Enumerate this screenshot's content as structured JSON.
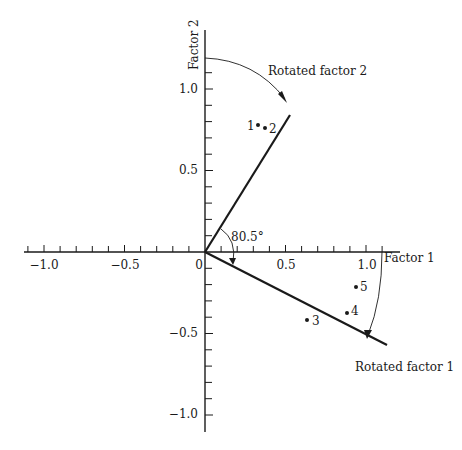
{
  "axes": {
    "x_label": "Factor 1",
    "y_label": "Factor 2",
    "x_ticks": [
      {
        "value": -1.0,
        "label": "−1.0"
      },
      {
        "value": -0.5,
        "label": "−0.5"
      },
      {
        "value": 0,
        "label": "0"
      },
      {
        "value": 0.5,
        "label": "0.5"
      },
      {
        "value": 1.0,
        "label": "1.0"
      }
    ],
    "y_ticks": [
      {
        "value": 1.0,
        "label": "1.0"
      },
      {
        "value": 0.5,
        "label": "0.5"
      },
      {
        "value": -0.5,
        "label": "−0.5"
      },
      {
        "value": -1.0,
        "label": "−1.0"
      }
    ],
    "minor_tick_step": 0.1
  },
  "rotated_axes": {
    "factor1_label": "Rotated factor 1",
    "factor2_label": "Rotated factor 2",
    "angle_label": "80.5°"
  },
  "points": [
    {
      "label": "1",
      "x": 0.5,
      "y": 0.78
    },
    {
      "label": "2",
      "x": 0.54,
      "y": 0.76
    },
    {
      "label": "3",
      "x": 0.63,
      "y": -0.42
    },
    {
      "label": "4",
      "x": 0.88,
      "y": -0.37
    },
    {
      "label": "5",
      "x": 0.93,
      "y": -0.21
    }
  ],
  "colors": {
    "line": "#1a1a1a",
    "background": "#ffffff"
  }
}
